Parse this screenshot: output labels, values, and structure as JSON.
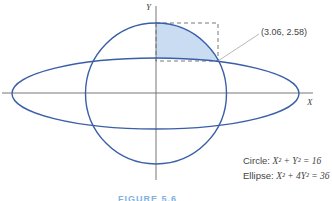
{
  "figure": {
    "axis_x_label": "X",
    "axis_y_label": "Y",
    "point_label": "(3.06, 2.58)",
    "legend": {
      "circle_prefix": "Circle: ",
      "circle_eq": "X² + Y² = 16",
      "ellipse_prefix": "Ellipse: ",
      "ellipse_eq": "X² + 4Y² = 36"
    },
    "caption": "FIGURE 5.6",
    "colors": {
      "curve": "#3a5fa8",
      "shade": "#c9dcf2",
      "axis": "#777777",
      "dash": "#555555"
    }
  }
}
